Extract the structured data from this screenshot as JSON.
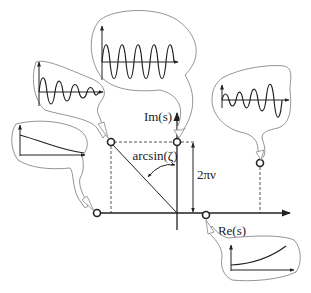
{
  "diagram": {
    "title": "",
    "type": "s-plane pole locations with impulse responses",
    "axes": {
      "imaginary_label": "Im(s)",
      "real_label": "Re(s)"
    },
    "annotations": {
      "angle_label": "arcsin(ζ)",
      "frequency_label": "2πν"
    },
    "poles": [
      {
        "id": "upper-left",
        "description": "complex pole, left half-plane",
        "response": "decaying oscillation"
      },
      {
        "id": "imaginary-axis",
        "description": "pole on imaginary axis",
        "response": "sustained oscillation"
      },
      {
        "id": "upper-right",
        "description": "complex pole, right half-plane",
        "response": "growing oscillation"
      },
      {
        "id": "real-negative",
        "description": "pole on negative real axis",
        "response": "exponential decay"
      },
      {
        "id": "real-positive",
        "description": "pole on positive real axis",
        "response": "exponential growth"
      }
    ],
    "colors": {
      "ink": "#222222",
      "bubble_outline": "#888888",
      "dashed": "#555555"
    }
  }
}
